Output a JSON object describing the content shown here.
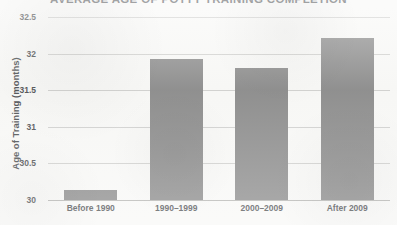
{
  "chart_data": {
    "type": "bar",
    "title": "AVERAGE AGE OF POTTY TRAINING COMPLETION",
    "xlabel": "",
    "ylabel": "Age of Training (months)",
    "categories": [
      "Before 1990",
      "1990–1999",
      "2000–2009",
      "After 2009"
    ],
    "values": [
      30.14,
      31.93,
      31.81,
      32.21
    ],
    "ylim": [
      30,
      32.5
    ],
    "ytick_labels": [
      "32.5",
      "32",
      "31.5",
      "31",
      "30.5",
      "30"
    ],
    "ytick_values": [
      32.5,
      32,
      31.5,
      31,
      30.5,
      30
    ],
    "grid": true,
    "legend": "none",
    "bar_color": "#767676",
    "gridline_color": "#c9c9c7",
    "background_color": "#f7f7f5",
    "text_color": "#2f3235"
  }
}
